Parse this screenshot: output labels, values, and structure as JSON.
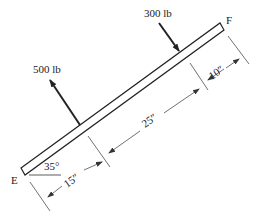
{
  "diagram": {
    "beam": {
      "left_end_label": "E",
      "right_end_label": "F",
      "angle_label": "35°"
    },
    "forces": [
      {
        "label": "300 lb",
        "direction": "down-right, perpendicular to beam"
      },
      {
        "label": "500 lb",
        "direction": "up-left, perpendicular to beam"
      }
    ],
    "dimensions": [
      {
        "label": "15″",
        "segment": "E to 500 lb load"
      },
      {
        "label": "25″",
        "segment": "500 lb load to 300 lb load"
      },
      {
        "label": "10″",
        "segment": "300 lb load to F"
      }
    ],
    "colors": {
      "ink": "#222222",
      "background": "#ffffff"
    }
  }
}
